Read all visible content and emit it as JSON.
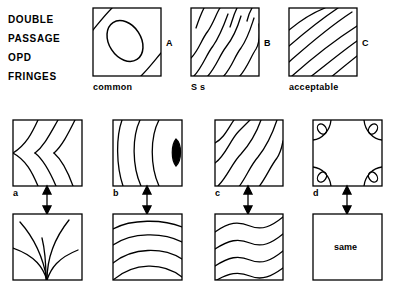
{
  "figure": {
    "background_color": "#ffffff",
    "ink_color": "#000000",
    "heading": {
      "lines": [
        "DOUBLE",
        "PASSAGE",
        "OPD",
        "FRINGES"
      ]
    },
    "top_row": {
      "panels": [
        {
          "letter": "A",
          "caption": "common",
          "pattern": "central-ellipse-with-corner-arcs"
        },
        {
          "letter": "B",
          "caption": "S s",
          "pattern": "diagonal-s-wave-fringes"
        },
        {
          "letter": "C",
          "caption": "acceptable",
          "pattern": "diagonal-smooth-curved-fringes"
        }
      ]
    },
    "middle_row": {
      "panels": [
        {
          "letter": "a",
          "pattern": "left-pointing-chevron-fringes"
        },
        {
          "letter": "b",
          "pattern": "nested-left-opening-arcs-with-dark-lens"
        },
        {
          "letter": "c",
          "pattern": "diagonal-s-wave-fringes"
        },
        {
          "letter": "d",
          "pattern": "four-corner-ellipses-with-arcs"
        }
      ]
    },
    "bottom_row": {
      "panels": [
        {
          "pattern": "bottom-fan-fountain-curves",
          "label": ""
        },
        {
          "pattern": "stacked-upward-arcs",
          "label": ""
        },
        {
          "pattern": "horizontal-s-wave-fringes",
          "label": ""
        },
        {
          "pattern": "empty-box",
          "label": "same"
        }
      ]
    },
    "connectors": {
      "type": "double-headed-vertical-arrow",
      "count": 4
    }
  }
}
